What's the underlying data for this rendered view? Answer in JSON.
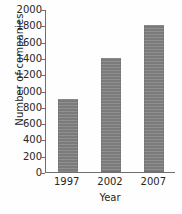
{
  "chart_data": {
    "type": "bar",
    "title": "",
    "xlabel": "Year",
    "ylabel": "Number of companies",
    "categories": [
      "1997",
      "2002",
      "2007"
    ],
    "values": [
      900,
      1400,
      1800
    ],
    "series": [
      {
        "name": "Number of companies",
        "values": [
          900,
          1400,
          1800
        ]
      }
    ],
    "ylim": [
      0,
      2000
    ],
    "ytick_step": 200,
    "ytick_labels": [
      "2000",
      "1800",
      "1600",
      "1400",
      "1200",
      "1000",
      "800",
      "600",
      "400",
      "200",
      "0"
    ],
    "ytick_values": [
      2000,
      1800,
      1600,
      1400,
      1200,
      1000,
      800,
      600,
      400,
      200,
      0
    ],
    "grid": false,
    "legend": false,
    "legend_position": "none",
    "bar_color": "#808080",
    "axis_color": "#6e6e6e",
    "text_color": "#262626",
    "background_color": "#fefefe"
  }
}
